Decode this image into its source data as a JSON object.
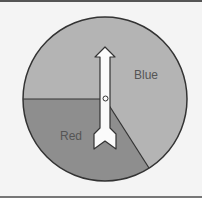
{
  "spinner": {
    "sections": [
      {
        "label": "Blue",
        "color": "#b4b4b4"
      },
      {
        "label": "Red",
        "color": "#8e8e8e"
      }
    ]
  }
}
